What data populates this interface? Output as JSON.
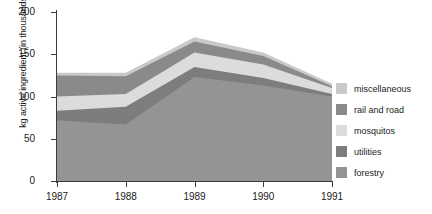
{
  "chart_data": {
    "type": "area",
    "title": "",
    "xlabel": "",
    "ylabel": "kg active ingredient (in thousands)",
    "categories": [
      "1987",
      "1988",
      "1989",
      "1990",
      "1991"
    ],
    "x": [
      1987,
      1988,
      1989,
      1990,
      1991
    ],
    "stacked": true,
    "grid": false,
    "legend_position": "right",
    "ylim": [
      0,
      200
    ],
    "yticks": [
      0,
      50,
      100,
      150,
      200
    ],
    "ytick_labels": [
      "0",
      "50",
      "100",
      "150",
      "200"
    ],
    "xtick_labels": [
      "1987",
      "1988",
      "1989",
      "1990",
      "1991"
    ],
    "series": [
      {
        "name": "forestry",
        "color": "#949494",
        "values": [
          72,
          67,
          123,
          113,
          100
        ],
        "cumulative": [
          72,
          67,
          123,
          113,
          100
        ]
      },
      {
        "name": "utilities",
        "color": "#7d7d7d",
        "values": [
          11,
          21,
          12,
          9,
          3
        ],
        "cumulative": [
          83,
          88,
          135,
          122,
          103
        ]
      },
      {
        "name": "mosquitos",
        "color": "#dcdcdc",
        "values": [
          17,
          15,
          17,
          16,
          7
        ],
        "cumulative": [
          100,
          103,
          152,
          138,
          110
        ]
      },
      {
        "name": "rail and road",
        "color": "#8a8a8a",
        "values": [
          25,
          21,
          13,
          10,
          2
        ],
        "cumulative": [
          125,
          124,
          165,
          148,
          112
        ]
      },
      {
        "name": "miscellaneous",
        "color": "#c9c9c9",
        "values": [
          3,
          4,
          5,
          4,
          3
        ],
        "cumulative": [
          128,
          128,
          170,
          152,
          115
        ]
      }
    ],
    "legend_entries": [
      {
        "label": "miscellaneous",
        "color": "#c9c9c9"
      },
      {
        "label": "rail and road",
        "color": "#8a8a8a"
      },
      {
        "label": "mosquitos",
        "color": "#dcdcdc"
      },
      {
        "label": "utilities",
        "color": "#7d7d7d"
      },
      {
        "label": "forestry",
        "color": "#949494"
      }
    ],
    "axis_color": "#3c3c3c",
    "background_color": "#ffffff"
  }
}
